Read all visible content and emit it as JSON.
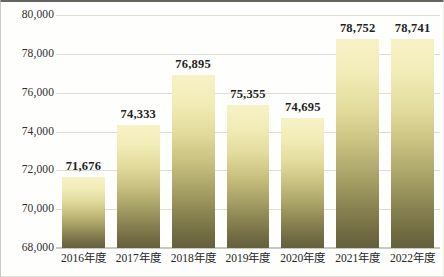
{
  "chart_data": {
    "type": "bar",
    "title": "",
    "subtitle": "",
    "xlabel": "",
    "ylabel": "",
    "categories": [
      "2016年度",
      "2017年度",
      "2018年度",
      "2019年度",
      "2020年度",
      "2021年度",
      "2022年度"
    ],
    "values": [
      71676,
      74333,
      76895,
      75355,
      74695,
      78752,
      78741
    ],
    "value_labels": [
      "71,676",
      "74,333",
      "76,895",
      "75,355",
      "74,695",
      "78,752",
      "78,741"
    ],
    "ylim": [
      68000,
      80000
    ],
    "ytick_values": [
      80000,
      78000,
      76000,
      74000,
      72000,
      70000,
      68000
    ],
    "ytick_labels": [
      "80,000",
      "78,000",
      "76,000",
      "74,000",
      "72,000",
      "70,000",
      "68,000"
    ],
    "ystep": 2000,
    "grid": true,
    "grid_axis": "y",
    "legend": false,
    "legend_position": "none",
    "data_labels": true,
    "colors": {
      "bar_gradient_top": "#F7F2C6",
      "bar_gradient_mid": "#C9C180",
      "bar_gradient_bottom": "#63603C",
      "gridline": "#DDDDD4",
      "axis_line": "#C9C9C0",
      "frame_top": "#4A4A44",
      "label_text": "#1F1F1F",
      "tick_text": "#2E2E2E",
      "background": "#FEFEFD"
    }
  }
}
